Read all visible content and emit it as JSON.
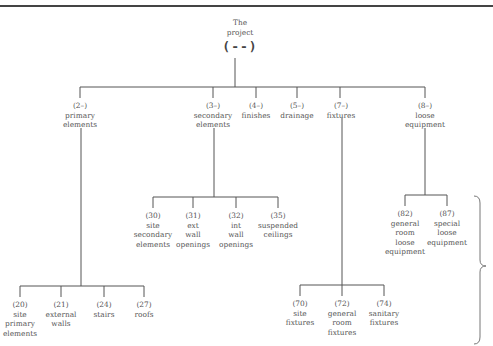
{
  "root": {
    "title_line1": "The",
    "title_line2": "project",
    "code": "(--)"
  },
  "level1": [
    {
      "code": "(2–)",
      "lines": [
        "primary",
        "elements"
      ]
    },
    {
      "code": "(3–)",
      "lines": [
        "secondary",
        "elements"
      ]
    },
    {
      "code": "(4–)",
      "lines": [
        "finishes"
      ]
    },
    {
      "code": "(5–)",
      "lines": [
        "drainage"
      ]
    },
    {
      "code": "(7–)",
      "lines": [
        "fixtures"
      ]
    },
    {
      "code": "(8–)",
      "lines": [
        "loose",
        "equipment"
      ]
    }
  ],
  "secondary_children": [
    {
      "code": "(30)",
      "lines": [
        "site",
        "secondary",
        "elements"
      ]
    },
    {
      "code": "(31)",
      "lines": [
        "ext",
        "wall",
        "openings"
      ]
    },
    {
      "code": "(32)",
      "lines": [
        "int",
        "wall",
        "openings"
      ]
    },
    {
      "code": "(35)",
      "lines": [
        "suspended",
        "ceilings"
      ]
    }
  ],
  "equipment_children": [
    {
      "code": "(82)",
      "lines": [
        "general",
        "room",
        "loose",
        "equipment"
      ]
    },
    {
      "code": "(87)",
      "lines": [
        "special",
        "loose",
        "equipment"
      ]
    }
  ],
  "primary_children": [
    {
      "code": "(20)",
      "lines": [
        "site",
        "primary",
        "elements"
      ]
    },
    {
      "code": "(21)",
      "lines": [
        "external",
        "walls"
      ]
    },
    {
      "code": "(24)",
      "lines": [
        "stairs"
      ]
    },
    {
      "code": "(27)",
      "lines": [
        "roofs"
      ]
    }
  ],
  "fixtures_children": [
    {
      "code": "(70)",
      "lines": [
        "site",
        "fixtures"
      ]
    },
    {
      "code": "(72)",
      "lines": [
        "general",
        "room",
        "fixtures"
      ]
    },
    {
      "code": "(74)",
      "lines": [
        "sanitary",
        "fixtures"
      ]
    }
  ]
}
